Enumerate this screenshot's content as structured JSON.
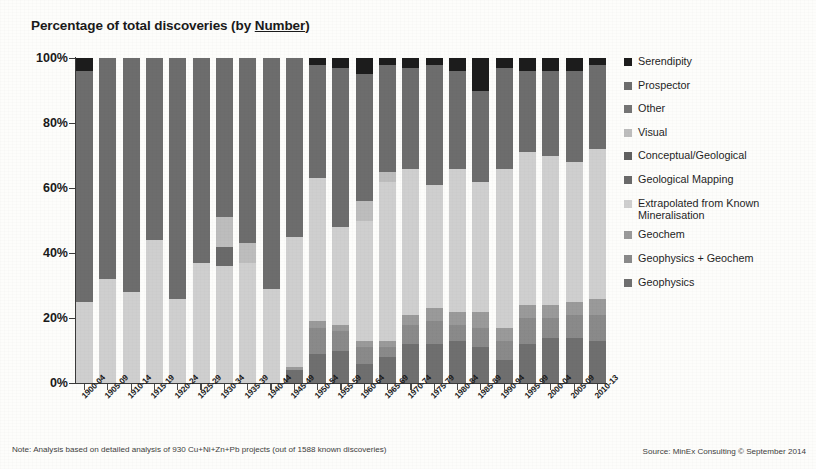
{
  "title": {
    "prefix": "Percentage of total discoveries (by ",
    "underlined": "Number",
    "suffix": ")"
  },
  "footer": {
    "note": "Note: Analysis based on detailed analysis of 930 Cu+Ni+Zn+Pb projects (out of 1588 known discoveries)",
    "source": "Source: MinEx Consulting © September 2014"
  },
  "legend": {
    "position": "right",
    "items": [
      {
        "label": "Serendipity",
        "color": "#1c1c1c"
      },
      {
        "label": "Prospector",
        "color": "#6d6d6d"
      },
      {
        "label": "Other",
        "color": "#757575"
      },
      {
        "label": "Visual",
        "color": "#bdbdbd"
      },
      {
        "label": "Conceptual/Geological",
        "color": "#606060"
      },
      {
        "label": "Geological Mapping",
        "color": "#6a6a6a"
      },
      {
        "label": "Extrapolated from Known Mineralisation",
        "color": "#cfcfcf"
      },
      {
        "label": "Geochem",
        "color": "#9a9a9a"
      },
      {
        "label": "Geophysics + Geochem",
        "color": "#8a8a8a"
      },
      {
        "label": "Geophysics",
        "color": "#6f6f6f"
      }
    ]
  },
  "chart_data": {
    "type": "bar",
    "stacked": true,
    "normalized": "100%",
    "title": "Percentage of total discoveries (by Number)",
    "xlabel": "",
    "ylabel": "",
    "ylim": [
      0,
      100
    ],
    "ytick_labels": [
      "0%",
      "20%",
      "40%",
      "60%",
      "80%",
      "100%"
    ],
    "ytick_values": [
      0,
      20,
      40,
      60,
      80,
      100
    ],
    "grid": false,
    "categories": [
      "1900-04",
      "1905-09",
      "1910-14",
      "1915-19",
      "1920-24",
      "1925-29",
      "1930-34",
      "1935-39",
      "1940-44",
      "1945-49",
      "1950-54",
      "1955-59",
      "1960-64",
      "1965-69",
      "1970-74",
      "1975-79",
      "1980-84",
      "1985-89",
      "1990-94",
      "1995-99",
      "2000-04",
      "2005-09",
      "2010-13"
    ],
    "series": [
      {
        "name": "Geophysics",
        "color": "#6f6f6f",
        "values": [
          0,
          0,
          0,
          0,
          0,
          0,
          0,
          0,
          0,
          4,
          9,
          10,
          6,
          8,
          12,
          12,
          13,
          11,
          7,
          12,
          14,
          14,
          13
        ]
      },
      {
        "name": "Geophysics + Geochem",
        "color": "#8a8a8a",
        "values": [
          0,
          0,
          0,
          0,
          0,
          0,
          0,
          0,
          0,
          0,
          8,
          6,
          5,
          3,
          6,
          7,
          5,
          6,
          6,
          8,
          6,
          7,
          8
        ]
      },
      {
        "name": "Geochem",
        "color": "#9a9a9a",
        "values": [
          0,
          0,
          0,
          0,
          0,
          0,
          0,
          0,
          0,
          1,
          2,
          2,
          2,
          2,
          3,
          4,
          4,
          5,
          4,
          4,
          4,
          4,
          5
        ]
      },
      {
        "name": "Extrapolated from Known Mineralisation",
        "color": "#cfcfcf",
        "values": [
          25,
          32,
          28,
          44,
          26,
          37,
          36,
          37,
          29,
          40,
          44,
          30,
          37,
          49,
          45,
          38,
          44,
          40,
          49,
          47,
          46,
          43,
          46
        ]
      },
      {
        "name": "Geological Mapping",
        "color": "#6a6a6a",
        "values": [
          0,
          0,
          0,
          0,
          0,
          0,
          6,
          0,
          0,
          0,
          0,
          0,
          0,
          0,
          0,
          0,
          0,
          0,
          0,
          0,
          0,
          0,
          0
        ]
      },
      {
        "name": "Conceptual/Geological",
        "color": "#606060",
        "values": [
          0,
          0,
          0,
          0,
          0,
          0,
          0,
          0,
          0,
          0,
          0,
          0,
          0,
          0,
          0,
          0,
          0,
          0,
          0,
          0,
          0,
          0,
          0
        ]
      },
      {
        "name": "Visual",
        "color": "#bdbdbd",
        "values": [
          0,
          0,
          0,
          0,
          0,
          0,
          9,
          6,
          0,
          0,
          0,
          0,
          6,
          3,
          0,
          0,
          0,
          0,
          0,
          0,
          0,
          0,
          0
        ]
      },
      {
        "name": "Other",
        "color": "#757575",
        "values": [
          0,
          0,
          0,
          0,
          0,
          0,
          0,
          0,
          0,
          0,
          0,
          0,
          0,
          0,
          0,
          0,
          0,
          0,
          0,
          0,
          0,
          0,
          0
        ]
      },
      {
        "name": "Prospector",
        "color": "#6d6d6d",
        "values": [
          71,
          68,
          72,
          56,
          74,
          63,
          49,
          57,
          71,
          55,
          35,
          49,
          39,
          33,
          31,
          37,
          30,
          28,
          31,
          25,
          26,
          28,
          26
        ]
      },
      {
        "name": "Serendipity",
        "color": "#1c1c1c",
        "values": [
          4,
          0,
          0,
          0,
          0,
          0,
          0,
          0,
          0,
          0,
          2,
          3,
          5,
          2,
          3,
          2,
          4,
          10,
          3,
          4,
          4,
          4,
          2
        ]
      }
    ],
    "stack_order_bottom_to_top": [
      "Geophysics",
      "Geophysics + Geochem",
      "Geochem",
      "Extrapolated from Known Mineralisation",
      "Geological Mapping",
      "Conceptual/Geological",
      "Visual",
      "Other",
      "Prospector",
      "Serendipity"
    ]
  }
}
